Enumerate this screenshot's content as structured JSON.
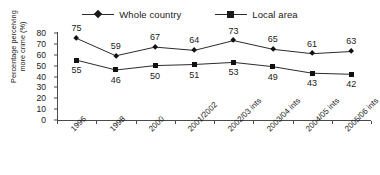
{
  "chart_data": {
    "type": "line",
    "title": "",
    "xlabel": "",
    "ylabel": "Percentage perceiving more crime (%)",
    "ylabel_lines": [
      "Percentage perceiving",
      "more crime (%)"
    ],
    "ylim": [
      0,
      80
    ],
    "yticks": [
      0,
      10,
      20,
      30,
      40,
      50,
      60,
      70,
      80
    ],
    "grid": false,
    "legend_position": "top",
    "categories": [
      "1996",
      "1998",
      "2000",
      "2001/2002",
      "2002/03 ints",
      "2003/04 ints",
      "2004/05 ints",
      "2005/06 ints"
    ],
    "series": [
      {
        "name": "Whole country",
        "marker": "diamond",
        "label_position": "above",
        "values": [
          75,
          59,
          67,
          64,
          73,
          65,
          61,
          63
        ]
      },
      {
        "name": "Local area",
        "marker": "square",
        "label_position": "below",
        "values": [
          55,
          46,
          50,
          51,
          53,
          49,
          43,
          42
        ]
      }
    ],
    "colors": {
      "line": "#2b2b2b",
      "marker": "#111111",
      "axis": "#4a4a4a",
      "text": "#1a1a1a",
      "background": "#ffffff"
    }
  }
}
